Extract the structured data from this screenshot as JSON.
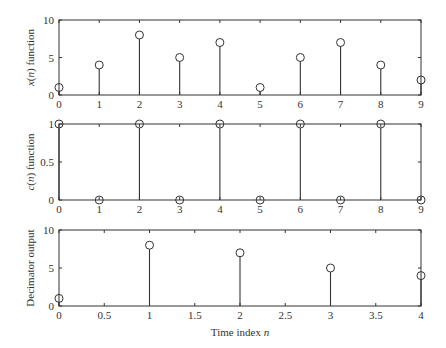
{
  "chart_data": [
    {
      "type": "stem",
      "title": "",
      "xlabel": "",
      "ylabel": "x(n) function",
      "ylabel_parts": {
        "var": "x",
        "arg": "n",
        "rest": " function"
      },
      "x": [
        0,
        1,
        2,
        3,
        4,
        5,
        6,
        7,
        8,
        9
      ],
      "values": [
        1,
        4,
        8,
        5,
        7,
        1,
        5,
        7,
        4,
        2
      ],
      "xlim": [
        0,
        9
      ],
      "ylim": [
        0,
        10
      ],
      "xticks": [
        0,
        1,
        2,
        3,
        4,
        5,
        6,
        7,
        8,
        9
      ],
      "yticks": [
        0,
        5,
        10
      ],
      "xtick_labels": [
        "0",
        "1",
        "2",
        "3",
        "4",
        "5",
        "6",
        "7",
        "8",
        "9"
      ],
      "ytick_labels": [
        "0",
        "5",
        "10"
      ],
      "grid": false
    },
    {
      "type": "stem",
      "title": "",
      "xlabel": "",
      "ylabel": "c(n) function",
      "ylabel_parts": {
        "var": "c",
        "arg": "n",
        "rest": " function"
      },
      "x": [
        0,
        1,
        2,
        3,
        4,
        5,
        6,
        7,
        8,
        9
      ],
      "values": [
        1,
        0,
        1,
        0,
        1,
        0,
        1,
        0,
        1,
        0
      ],
      "xlim": [
        0,
        9
      ],
      "ylim": [
        0,
        1
      ],
      "xticks": [
        0,
        1,
        2,
        3,
        4,
        5,
        6,
        7,
        8,
        9
      ],
      "yticks": [
        0,
        0.5,
        1
      ],
      "xtick_labels": [
        "0",
        "1",
        "2",
        "3",
        "4",
        "5",
        "6",
        "7",
        "8",
        "9"
      ],
      "ytick_labels": [
        "0",
        "0.5",
        "1"
      ],
      "grid": false
    },
    {
      "type": "stem",
      "title": "",
      "xlabel": "Time index n",
      "xlabel_parts": {
        "text": "Time index ",
        "var": "n"
      },
      "ylabel": "Decimator output",
      "x": [
        0,
        1,
        2,
        3,
        4
      ],
      "values": [
        1,
        8,
        7,
        5,
        4
      ],
      "xlim": [
        0,
        4
      ],
      "ylim": [
        0,
        10
      ],
      "xticks": [
        0,
        0.5,
        1,
        1.5,
        2,
        2.5,
        3,
        3.5,
        4
      ],
      "yticks": [
        0,
        5,
        10
      ],
      "xtick_labels": [
        "0",
        "0.5",
        "1",
        "1.5",
        "2",
        "2.5",
        "3",
        "3.5",
        "4"
      ],
      "ytick_labels": [
        "0",
        "5",
        "10"
      ],
      "grid": false
    }
  ],
  "colors": {
    "line": "#333333",
    "background": "#ffffff"
  }
}
